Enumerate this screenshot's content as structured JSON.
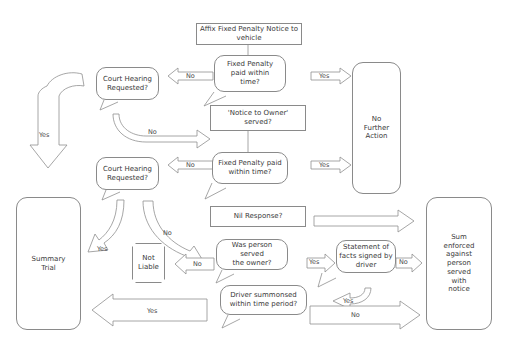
{
  "diagram": {
    "stroke_color": "#8f8f8f",
    "text_color": "#3a3a3a",
    "background": "#ffffff"
  },
  "nodes": {
    "affix_notice": "Affix Fixed Penalty Notice to vehicle",
    "fixed_penalty_paid_1": "Fixed Penalty\npaid within\ntime?",
    "court_hearing_1": "Court Hearing\nRequested?",
    "no_further_action": "No\nFurther\nAction",
    "notice_to_owner": "'Notice to Owner' served?",
    "fixed_penalty_paid_2": "Fixed Penalty paid\nwithin time?",
    "court_hearing_2": "Court Hearing\nRequested?",
    "summary_trial": "Summary\nTrial",
    "nil_response": "Nil Response?",
    "sum_enforced": "Sum\nenforced\nagainst\nperson\nserved\nwith\nnotice",
    "not_liable": "Not\nLiable",
    "was_person_served": "Was person served\nthe owner?",
    "statement_of_facts": "Statement of\nfacts signed by\ndriver",
    "driver_summonsed": "Driver summonsed\nwithin time period?"
  },
  "edges": {
    "fp1_no": "No",
    "fp1_yes": "Yes",
    "ch1_yes": "Yes",
    "ch1_no": "No",
    "fp2_no": "No",
    "fp2_yes": "Yes",
    "ch2_yes": "Yes",
    "ch2_no": "No",
    "served_no": "No",
    "served_yes": "Yes",
    "statement_no": "No",
    "statement_yes": "Yes",
    "driver_yes": "Yes",
    "driver_no": "No"
  }
}
